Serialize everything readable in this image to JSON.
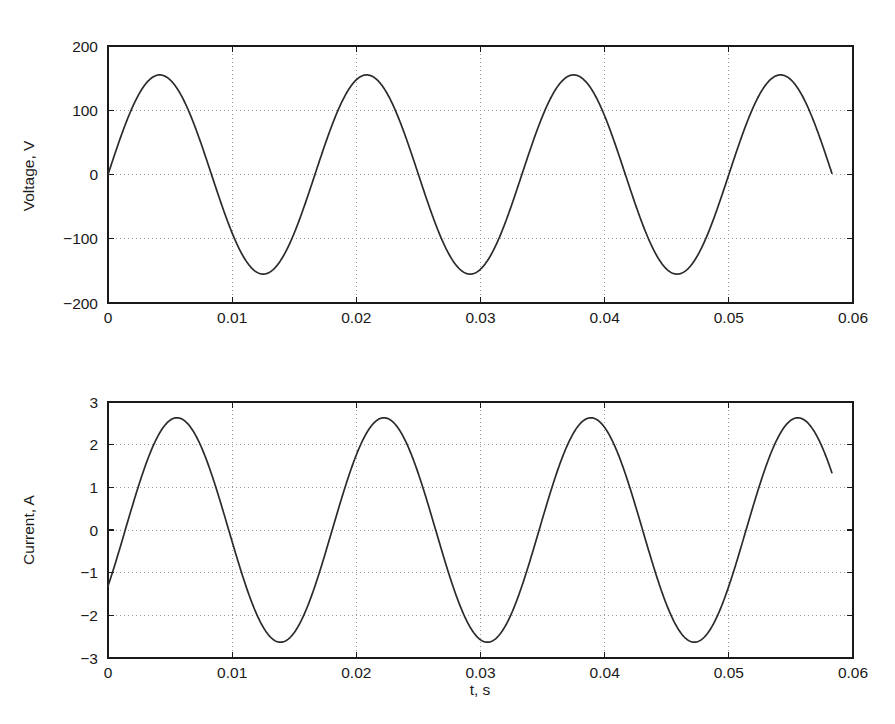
{
  "figure": {
    "background": "#ffffff",
    "line_color": "#2b2b2b",
    "axis_color": "#1a1a1a",
    "grid_color": "#9a9a9a",
    "clipped_header_text": ""
  },
  "chart_data": [
    {
      "id": "voltage",
      "type": "line",
      "title": "",
      "xlabel": "",
      "ylabel": "Voltage, V",
      "xlim": [
        0,
        0.06
      ],
      "ylim": [
        -200,
        200
      ],
      "xticks": [
        0,
        0.01,
        0.02,
        0.03,
        0.04,
        0.05,
        0.06
      ],
      "xticklabels": [
        "0",
        "0.01",
        "0.02",
        "0.03",
        "0.04",
        "0.05",
        "0.06"
      ],
      "yticks": [
        -200,
        -100,
        0,
        100,
        200
      ],
      "yticklabels": [
        "-200",
        "-100",
        "0",
        "100",
        "200"
      ],
      "grid": true,
      "grid_style": "dotted",
      "legend": null,
      "series": [
        {
          "name": "voltage",
          "waveform": "sine",
          "amplitude": 155,
          "frequency_hz": 60,
          "phase_deg": 0,
          "offset": 0,
          "t_start": 0,
          "t_end": 0.0583,
          "start_value": 0,
          "end_value": 0,
          "peaks_t": [
            0.0042,
            0.0208,
            0.0375,
            0.0542
          ],
          "peaks_v": [
            155,
            155,
            155,
            155
          ],
          "troughs_t": [
            0.0125,
            0.0292,
            0.0458
          ],
          "troughs_v": [
            -155,
            -155,
            -155
          ]
        }
      ]
    },
    {
      "id": "current",
      "type": "line",
      "title": "",
      "xlabel": "t, s",
      "ylabel": "Current, A",
      "xlim": [
        0,
        0.06
      ],
      "ylim": [
        -3,
        3
      ],
      "xticks": [
        0,
        0.01,
        0.02,
        0.03,
        0.04,
        0.05,
        0.06
      ],
      "xticklabels": [
        "0",
        "0.01",
        "0.02",
        "0.03",
        "0.04",
        "0.05",
        "0.06"
      ],
      "yticks": [
        -3,
        -2,
        -1,
        0,
        1,
        2,
        3
      ],
      "yticklabels": [
        "-3",
        "-2",
        "-1",
        "0",
        "1",
        "2",
        "3"
      ],
      "grid": true,
      "grid_style": "dotted",
      "legend": null,
      "series": [
        {
          "name": "current",
          "waveform": "sine",
          "amplitude": 2.63,
          "frequency_hz": 60,
          "phase_deg": -30,
          "offset": 0,
          "t_start": 0,
          "t_end": 0.0583,
          "start_value": -1.32,
          "end_value": 1.4,
          "peaks_t": [
            0.0056,
            0.0222,
            0.0389,
            0.0556
          ],
          "peaks_v": [
            2.63,
            2.63,
            2.63,
            2.63
          ],
          "troughs_t": [
            0.0139,
            0.0306,
            0.0472
          ],
          "troughs_v": [
            -2.63,
            -2.63,
            -2.63
          ]
        }
      ]
    }
  ]
}
